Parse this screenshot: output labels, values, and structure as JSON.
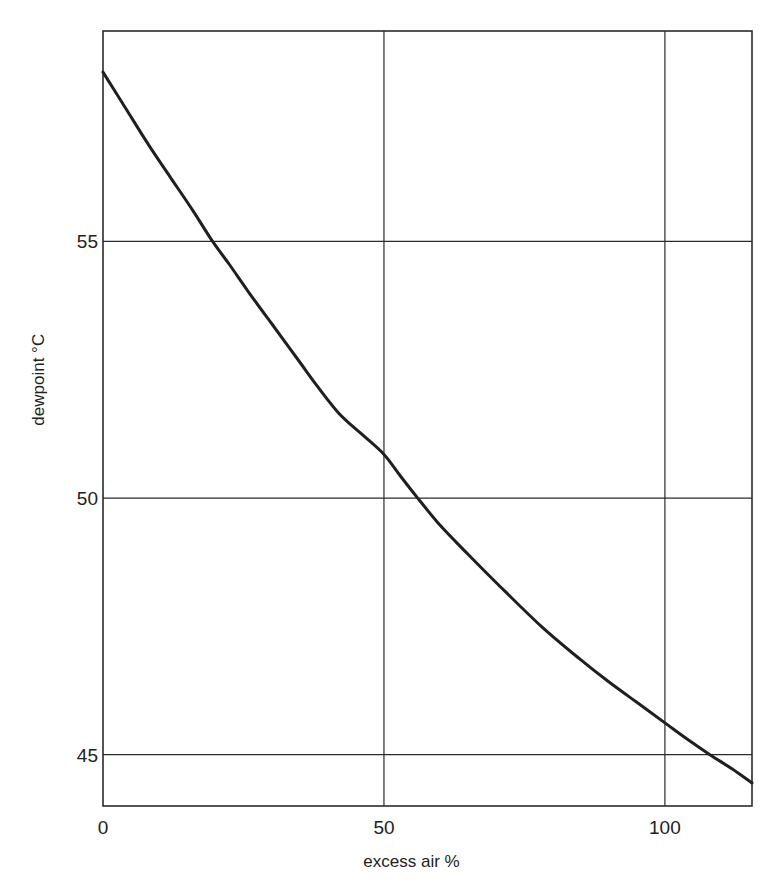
{
  "chart_data": {
    "type": "line",
    "title": "",
    "xlabel": "excess air %",
    "ylabel": "dewpoint °C",
    "xlim": [
      0,
      115.5
    ],
    "ylim": [
      44,
      59.1
    ],
    "grid": true,
    "xticks": [
      0,
      50,
      100
    ],
    "xtick_labels": [
      "0",
      "50",
      "100"
    ],
    "yticks": [
      45,
      50,
      55
    ],
    "ytick_labels": [
      "45",
      "50",
      "55"
    ],
    "series": [
      {
        "name": "dewpoint",
        "x": [
          0,
          4,
          8,
          12,
          16,
          19.5,
          22.5,
          26,
          30,
          35,
          38,
          42,
          46,
          50,
          53,
          56,
          60,
          65,
          70,
          78,
          85,
          90,
          95,
          100,
          104,
          108,
          112,
          115.5
        ],
        "y": [
          58.3,
          57.6,
          56.9,
          56.25,
          55.6,
          55.0,
          54.55,
          54.0,
          53.4,
          52.65,
          52.2,
          51.65,
          51.25,
          50.85,
          50.42,
          50.0,
          49.47,
          48.9,
          48.35,
          47.5,
          46.85,
          46.42,
          46.02,
          45.62,
          45.3,
          45.0,
          44.72,
          44.45
        ]
      }
    ]
  }
}
